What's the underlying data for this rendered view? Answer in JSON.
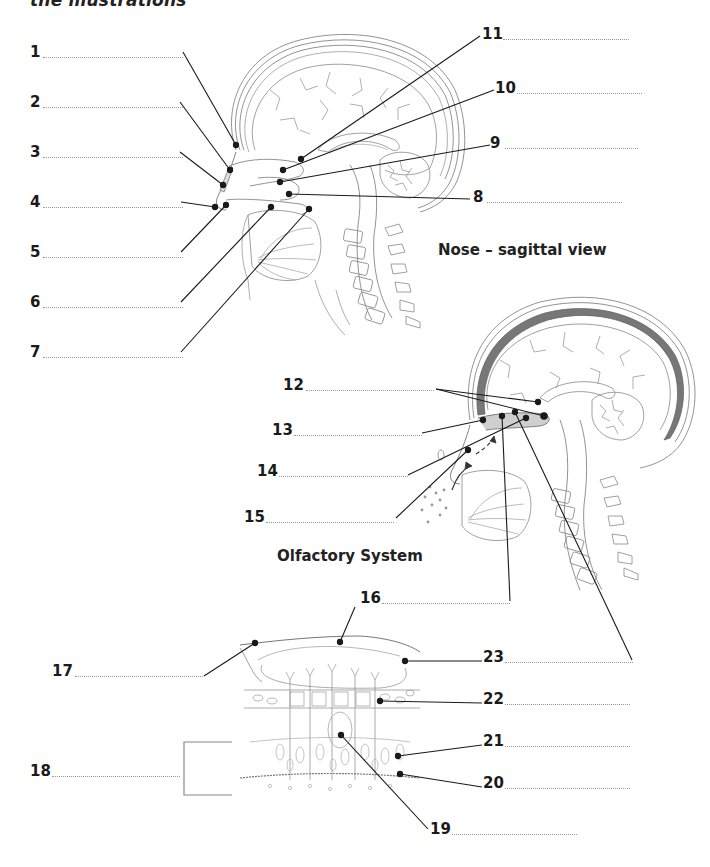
{
  "header": {
    "text": "the illustrations"
  },
  "titles": {
    "nose": "Nose – sagittal view",
    "olfactory": "Olfactory System"
  },
  "labels": [
    {
      "n": "1",
      "x": 30,
      "y": 44,
      "dot_x": 43,
      "dot_w": 140
    },
    {
      "n": "2",
      "x": 30,
      "y": 94,
      "dot_x": 43,
      "dot_w": 140
    },
    {
      "n": "3",
      "x": 30,
      "y": 144,
      "dot_x": 43,
      "dot_w": 140
    },
    {
      "n": "4",
      "x": 30,
      "y": 194,
      "dot_x": 43,
      "dot_w": 140
    },
    {
      "n": "5",
      "x": 30,
      "y": 244,
      "dot_x": 43,
      "dot_w": 140
    },
    {
      "n": "6",
      "x": 30,
      "y": 294,
      "dot_x": 43,
      "dot_w": 140
    },
    {
      "n": "7",
      "x": 30,
      "y": 344,
      "dot_x": 43,
      "dot_w": 140
    },
    {
      "n": "8",
      "x": 473,
      "y": 189,
      "dot_x": 487,
      "dot_w": 135
    },
    {
      "n": "9",
      "x": 490,
      "y": 135,
      "dot_x": 505,
      "dot_w": 133
    },
    {
      "n": "10",
      "x": 495,
      "y": 80,
      "dot_x": 517,
      "dot_w": 125
    },
    {
      "n": "11",
      "x": 482,
      "y": 26,
      "dot_x": 503,
      "dot_w": 126
    },
    {
      "n": "12",
      "x": 283,
      "y": 377,
      "dot_x": 306,
      "dot_w": 128
    },
    {
      "n": "13",
      "x": 272,
      "y": 422,
      "dot_x": 294,
      "dot_w": 128
    },
    {
      "n": "14",
      "x": 257,
      "y": 463,
      "dot_x": 279,
      "dot_w": 129
    },
    {
      "n": "15",
      "x": 244,
      "y": 509,
      "dot_x": 266,
      "dot_w": 128
    },
    {
      "n": "16",
      "x": 360,
      "y": 590,
      "dot_x": 382,
      "dot_w": 128
    },
    {
      "n": "17",
      "x": 52,
      "y": 663,
      "dot_x": 75,
      "dot_w": 128
    },
    {
      "n": "18",
      "x": 30,
      "y": 763,
      "dot_x": 52,
      "dot_w": 128
    },
    {
      "n": "19",
      "x": 430,
      "y": 821,
      "dot_x": 452,
      "dot_w": 125
    },
    {
      "n": "20",
      "x": 483,
      "y": 775,
      "dot_x": 505,
      "dot_w": 125
    },
    {
      "n": "21",
      "x": 483,
      "y": 733,
      "dot_x": 505,
      "dot_w": 125
    },
    {
      "n": "22",
      "x": 483,
      "y": 691,
      "dot_x": 505,
      "dot_w": 125
    },
    {
      "n": "23",
      "x": 483,
      "y": 649,
      "dot_x": 505,
      "dot_w": 128
    }
  ],
  "leaders": [
    {
      "id": "1",
      "x1": 183,
      "y1": 52,
      "x2": 236,
      "y2": 145
    },
    {
      "id": "2",
      "x1": 180,
      "y1": 102,
      "x2": 230,
      "y2": 170
    },
    {
      "id": "3",
      "x1": 180,
      "y1": 152,
      "x2": 223,
      "y2": 185
    },
    {
      "id": "4",
      "x1": 181,
      "y1": 202,
      "x2": 215,
      "y2": 207
    },
    {
      "id": "5",
      "x1": 181,
      "y1": 252,
      "x2": 226,
      "y2": 205
    },
    {
      "id": "6",
      "x1": 181,
      "y1": 302,
      "x2": 271,
      "y2": 207
    },
    {
      "id": "7",
      "x1": 181,
      "y1": 352,
      "x2": 309,
      "y2": 209
    },
    {
      "id": "8",
      "x1": 470,
      "y1": 199,
      "x2": 289,
      "y2": 194
    },
    {
      "id": "9",
      "x1": 490,
      "y1": 145,
      "x2": 280,
      "y2": 182
    },
    {
      "id": "10",
      "x1": 494,
      "y1": 90,
      "x2": 283,
      "y2": 170
    },
    {
      "id": "11",
      "x1": 480,
      "y1": 36,
      "x2": 301,
      "y2": 159
    },
    {
      "id": "12a",
      "x1": 436,
      "y1": 389,
      "x2": 538,
      "y2": 402
    },
    {
      "id": "12b",
      "x1": 436,
      "y1": 389,
      "x2": 544,
      "y2": 416
    },
    {
      "id": "13",
      "x1": 422,
      "y1": 433,
      "x2": 483,
      "y2": 420
    },
    {
      "id": "14",
      "x1": 408,
      "y1": 475,
      "x2": 526,
      "y2": 418
    },
    {
      "id": "15",
      "x1": 396,
      "y1": 518,
      "x2": 468,
      "y2": 450
    },
    {
      "id": "16v",
      "x1": 510,
      "y1": 601,
      "x2": 502,
      "y2": 416
    },
    {
      "id": "16b",
      "x1": 355,
      "y1": 607,
      "x2": 340,
      "y2": 642
    },
    {
      "id": "23long",
      "x1": 632,
      "y1": 660,
      "x2": 515,
      "y2": 412
    },
    {
      "id": "17",
      "x1": 204,
      "y1": 676,
      "x2": 255,
      "y2": 643
    },
    {
      "id": "23",
      "x1": 482,
      "y1": 661,
      "x2": 405,
      "y2": 661
    },
    {
      "id": "22",
      "x1": 482,
      "y1": 703,
      "x2": 380,
      "y2": 701
    },
    {
      "id": "21",
      "x1": 482,
      "y1": 745,
      "x2": 398,
      "y2": 756
    },
    {
      "id": "20",
      "x1": 482,
      "y1": 787,
      "x2": 400,
      "y2": 774
    },
    {
      "id": "19",
      "x1": 428,
      "y1": 829,
      "x2": 341,
      "y2": 735
    }
  ],
  "bracket": {
    "x": 184,
    "y1": 742,
    "y2": 795,
    "w": 48
  }
}
